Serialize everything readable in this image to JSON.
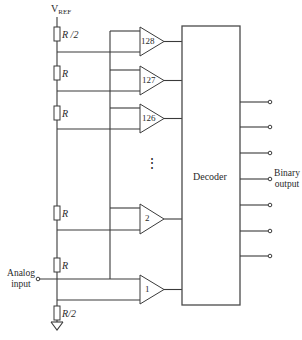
{
  "diagram": {
    "type": "flash-adc-circuit",
    "supply_label": "V",
    "supply_subscript": "REF",
    "resistors": [
      {
        "label": "R /2"
      },
      {
        "label": "R"
      },
      {
        "label": "R"
      },
      {
        "label": "R"
      },
      {
        "label": "R"
      },
      {
        "label": "R/2"
      }
    ],
    "comparators": [
      {
        "label": "128"
      },
      {
        "label": "127"
      },
      {
        "label": "126"
      },
      {
        "label": "2"
      },
      {
        "label": "1"
      }
    ],
    "ellipsis": "⋮",
    "decoder_label": "Decoder",
    "input_label_line1": "Analog",
    "input_label_line2": "input",
    "output_label_line1": "Binary",
    "output_label_line2": "output",
    "output_count": 7,
    "ground_icon": "ground-symbol"
  }
}
